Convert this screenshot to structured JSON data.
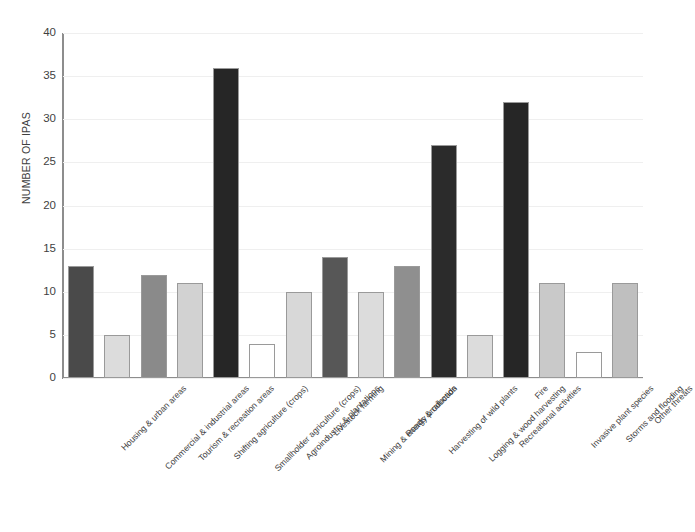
{
  "chart_data": {
    "type": "bar",
    "title": "",
    "xlabel": "",
    "ylabel": "NUMBER OF IPAS",
    "ylim": [
      0,
      40
    ],
    "ytick_step": 5,
    "yticks": [
      "40",
      "35",
      "30",
      "25",
      "20",
      "15",
      "10",
      "5",
      "0"
    ],
    "grid": true,
    "legend": "none",
    "categories": [
      "Housing & urban areas",
      "Commercial & industrial areas",
      "Tourism & recreation areas",
      "Shifting agriculture (crops)",
      "Smallholder agriculture (crops)",
      "Agroindustry & plantations",
      "Livestock farming",
      "Mining & energy production",
      "Roads & railroads",
      "Harvesting of wild plants",
      "Logging & wood harvesting",
      "Recreational activities",
      "Fire",
      "Invasive plant species",
      "Storms and flooding",
      "Other threats"
    ],
    "values": [
      13,
      5,
      12,
      11,
      36,
      4,
      10,
      14,
      10,
      13,
      27,
      5,
      32,
      11,
      3,
      11
    ],
    "bar_colors": [
      "#4a4a4a",
      "#dcdcdc",
      "#8a8a8a",
      "#d2d2d2",
      "#262626",
      "#ffffff",
      "#d8d8d8",
      "#575757",
      "#dcdcdc",
      "#8f8f8f",
      "#2b2b2b",
      "#dcdcdc",
      "#262626",
      "#c9c9c9",
      "#ffffff",
      "#bfbfbf"
    ]
  },
  "style": {
    "axis_color": "#8d8d8d",
    "grid_color": "#efefef",
    "bar_border": "#9a9a9a",
    "text_color": "#3d3d3d",
    "background": "#ffffff"
  }
}
